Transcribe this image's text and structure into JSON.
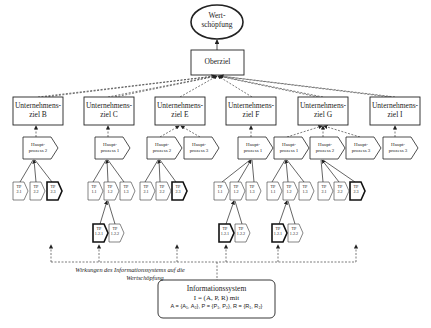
{
  "diagram": {
    "top": {
      "label_line1": "Wert-",
      "label_line2": "schöpfung"
    },
    "oberziel": {
      "label": "Oberziel"
    },
    "unternehmensziele": [
      {
        "id": "B",
        "line1": "Unternehmens-",
        "line2": "ziel B",
        "x": 13
      },
      {
        "id": "C",
        "line1": "Unternehmens-",
        "line2": "ziel C",
        "x": 84
      },
      {
        "id": "E",
        "line1": "Unternehmens-",
        "line2": "ziel E",
        "x": 155
      },
      {
        "id": "F",
        "line1": "Unternehmens-",
        "line2": "ziel F",
        "x": 226
      },
      {
        "id": "G",
        "line1": "Unternehmens-",
        "line2": "ziel G",
        "x": 298
      },
      {
        "id": "I",
        "line1": "Unternehmens-",
        "line2": "ziel I",
        "x": 370
      }
    ],
    "hauptprozesse": [
      {
        "under": "B",
        "line1": "Haupt-",
        "line2": "prozess 2"
      },
      {
        "under": "C",
        "line1": "Haupt-",
        "line2": "prozess 1"
      },
      {
        "under": "E",
        "line1": "Haupt-",
        "line2": "prozess 2"
      },
      {
        "under": "E",
        "line1": "Haupt-",
        "line2": "prozess 3"
      },
      {
        "under": "F",
        "line1": "Haupt-",
        "line2": "prozess 1"
      },
      {
        "under": "G",
        "line1": "Haupt-",
        "line2": "prozess 1"
      },
      {
        "under": "G",
        "line1": "Haupt-",
        "line2": "prozess 2"
      },
      {
        "under": "G",
        "line1": "Haupt-",
        "line2": "prozess 3"
      },
      {
        "under": "I",
        "line1": "Haupt-",
        "line2": "prozess 3"
      }
    ],
    "teilprozesse": [
      {
        "line1": "TP",
        "line2": "2.1",
        "bold": false
      },
      {
        "line1": "TP",
        "line2": "2.2",
        "bold": false
      },
      {
        "line1": "TP",
        "line2": "2.3",
        "bold": true
      },
      {
        "line1": "TP",
        "line2": "1.1",
        "bold": false
      },
      {
        "line1": "TP",
        "line2": "1.2",
        "bold": false
      },
      {
        "line1": "TP",
        "line2": "1.3",
        "bold": false
      },
      {
        "line1": "TP",
        "line2": "2.1",
        "bold": false
      },
      {
        "line1": "TP",
        "line2": "2.2",
        "bold": false
      },
      {
        "line1": "TP",
        "line2": "2.3",
        "bold": true
      },
      {
        "line1": "TP",
        "line2": "1.1",
        "bold": false
      },
      {
        "line1": "TP",
        "line2": "1.2",
        "bold": false
      },
      {
        "line1": "TP",
        "line2": "1.3",
        "bold": false
      },
      {
        "line1": "TP",
        "line2": "1.1",
        "bold": false
      },
      {
        "line1": "TP",
        "line2": "1.2",
        "bold": false
      },
      {
        "line1": "TP",
        "line2": "1.3",
        "bold": false
      },
      {
        "line1": "TP",
        "line2": "2.1",
        "bold": false
      },
      {
        "line1": "TP",
        "line2": "2.2",
        "bold": false
      },
      {
        "line1": "TP",
        "line2": "2.3",
        "bold": true
      }
    ],
    "sub_teilprozesse": [
      {
        "line1": "TP",
        "line2": "1.2.1",
        "bold": true
      },
      {
        "line1": "TP",
        "line2": "1.2.2",
        "bold": false
      },
      {
        "line1": "TP",
        "line2": "1.2.1",
        "bold": true
      },
      {
        "line1": "TP",
        "line2": "1.2.2",
        "bold": false
      },
      {
        "line1": "TP",
        "line2": "1.2.1",
        "bold": true
      },
      {
        "line1": "TP",
        "line2": "1.2.2",
        "bold": false
      }
    ],
    "caption": {
      "line1": "Wirkungen des Informationssystems auf die",
      "line2": "Wertschöpfung"
    },
    "info_system": {
      "line1": "Informationssystem",
      "line2": "I = (A, P, R) mit",
      "line3": "A = {A₁, A₂}, P = {P₁, P₂}, R = {R₁, R₂}"
    }
  }
}
